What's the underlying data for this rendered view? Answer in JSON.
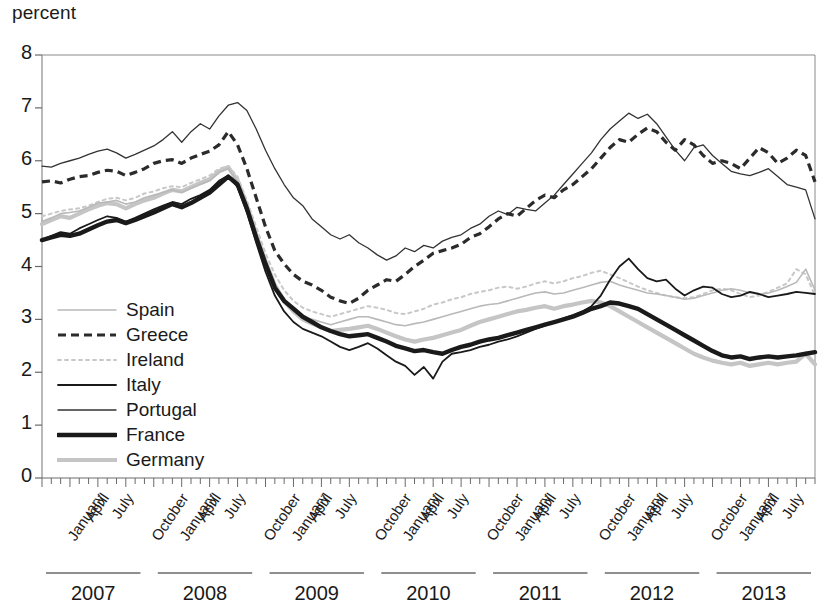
{
  "chart_data": {
    "type": "line",
    "title": "percent",
    "ylabel": "percent",
    "xlabel": "",
    "ylim": [
      0,
      8
    ],
    "yticks": [
      0,
      1,
      2,
      3,
      4,
      5,
      6,
      7,
      8
    ],
    "grid": false,
    "legend_position": "inside-left",
    "x_tick_labels": [
      "January",
      "April",
      "July",
      "October",
      "January",
      "April",
      "July",
      "October",
      "January",
      "April",
      "July",
      "October",
      "January",
      "April",
      "July",
      "October",
      "January",
      "April",
      "July",
      "October",
      "January",
      "April",
      "July",
      "October",
      "January",
      "April",
      "July",
      "December"
    ],
    "x_group_labels": [
      "2007",
      "2008",
      "2009",
      "2010",
      "2011",
      "2012",
      "2013"
    ],
    "x_months_per_group": 12,
    "x_start": "2007-01",
    "x_end": "2013-12",
    "series": [
      {
        "name": "Spain",
        "style": "thin-light-gray",
        "color": "#b9b9b9",
        "values": [
          4.85,
          4.92,
          5.0,
          5.02,
          5.05,
          5.12,
          5.2,
          5.22,
          5.25,
          5.18,
          5.22,
          5.3,
          5.35,
          5.4,
          5.45,
          5.4,
          5.48,
          5.55,
          5.62,
          5.78,
          5.85,
          5.6,
          5.1,
          4.55,
          4.05,
          3.6,
          3.3,
          3.15,
          3.05,
          3.0,
          2.95,
          2.9,
          2.95,
          3.0,
          3.05,
          3.05,
          3.0,
          2.95,
          2.9,
          2.88,
          2.92,
          2.95,
          3.0,
          3.05,
          3.1,
          3.15,
          3.2,
          3.25,
          3.28,
          3.3,
          3.35,
          3.4,
          3.45,
          3.5,
          3.52,
          3.48,
          3.5,
          3.55,
          3.6,
          3.65,
          3.7,
          3.72,
          3.65,
          3.6,
          3.55,
          3.5,
          3.48,
          3.45,
          3.42,
          3.38,
          3.4,
          3.45,
          3.5,
          3.55,
          3.58,
          3.55,
          3.5,
          3.48,
          3.5,
          3.55,
          3.62,
          3.7,
          3.95,
          3.55
        ]
      },
      {
        "name": "Greece",
        "style": "dashed-black",
        "color": "#2b2b2b",
        "values": [
          5.6,
          5.62,
          5.58,
          5.65,
          5.7,
          5.72,
          5.78,
          5.82,
          5.8,
          5.72,
          5.78,
          5.85,
          5.95,
          6.0,
          6.02,
          5.95,
          6.05,
          6.12,
          6.18,
          6.3,
          6.55,
          6.3,
          5.85,
          5.3,
          4.75,
          4.3,
          4.05,
          3.85,
          3.72,
          3.65,
          3.55,
          3.42,
          3.35,
          3.3,
          3.4,
          3.55,
          3.65,
          3.75,
          3.72,
          3.85,
          4.0,
          4.12,
          4.25,
          4.3,
          4.35,
          4.42,
          4.55,
          4.62,
          4.75,
          4.9,
          5.0,
          4.95,
          5.1,
          5.25,
          5.35,
          5.3,
          5.45,
          5.55,
          5.7,
          5.85,
          6.05,
          6.25,
          6.4,
          6.35,
          6.5,
          6.62,
          6.55,
          6.35,
          6.2,
          6.4,
          6.3,
          6.1,
          5.95,
          6.0,
          5.95,
          5.85,
          6.05,
          6.25,
          6.15,
          5.95,
          6.05,
          6.2,
          6.1,
          5.6
        ]
      },
      {
        "name": "Ireland",
        "style": "dotted-light-gray",
        "color": "#c8c8c8",
        "values": [
          4.95,
          5.0,
          5.05,
          5.08,
          5.1,
          5.15,
          5.22,
          5.28,
          5.3,
          5.25,
          5.3,
          5.38,
          5.42,
          5.48,
          5.52,
          5.5,
          5.58,
          5.65,
          5.72,
          5.85,
          5.9,
          5.7,
          5.25,
          4.75,
          4.25,
          3.85,
          3.55,
          3.35,
          3.22,
          3.15,
          3.1,
          3.05,
          3.1,
          3.15,
          3.2,
          3.25,
          3.22,
          3.18,
          3.12,
          3.1,
          3.15,
          3.2,
          3.28,
          3.32,
          3.38,
          3.42,
          3.48,
          3.52,
          3.55,
          3.6,
          3.62,
          3.58,
          3.62,
          3.68,
          3.72,
          3.68,
          3.72,
          3.78,
          3.82,
          3.88,
          3.92,
          3.85,
          3.78,
          3.7,
          3.62,
          3.55,
          3.5,
          3.45,
          3.42,
          3.4,
          3.42,
          3.48,
          3.55,
          3.58,
          3.55,
          3.48,
          3.42,
          3.45,
          3.52,
          3.6,
          3.68,
          3.95,
          3.85,
          3.45
        ]
      },
      {
        "name": "Italy",
        "style": "thin-black",
        "color": "#1a1a1a",
        "values": [
          4.5,
          4.58,
          4.65,
          4.62,
          4.72,
          4.8,
          4.88,
          4.95,
          4.92,
          4.85,
          4.92,
          5.0,
          5.08,
          5.15,
          5.22,
          5.18,
          5.28,
          5.35,
          5.45,
          5.62,
          5.72,
          5.5,
          5.02,
          4.45,
          3.9,
          3.45,
          3.15,
          2.95,
          2.82,
          2.75,
          2.68,
          2.58,
          2.48,
          2.42,
          2.48,
          2.55,
          2.45,
          2.32,
          2.2,
          2.12,
          1.95,
          2.1,
          1.88,
          2.2,
          2.35,
          2.38,
          2.42,
          2.48,
          2.52,
          2.58,
          2.62,
          2.68,
          2.75,
          2.82,
          2.88,
          2.95,
          3.02,
          3.08,
          3.15,
          3.25,
          3.45,
          3.75,
          4.0,
          4.15,
          3.95,
          3.78,
          3.72,
          3.75,
          3.58,
          3.45,
          3.55,
          3.62,
          3.6,
          3.48,
          3.42,
          3.45,
          3.52,
          3.48,
          3.42,
          3.45,
          3.48,
          3.52,
          3.5,
          3.48
        ]
      },
      {
        "name": "Portugal",
        "style": "thin-black-fine",
        "color": "#333333",
        "values": [
          5.9,
          5.88,
          5.95,
          6.0,
          6.05,
          6.12,
          6.18,
          6.22,
          6.15,
          6.05,
          6.12,
          6.2,
          6.28,
          6.4,
          6.55,
          6.35,
          6.55,
          6.7,
          6.6,
          6.85,
          7.05,
          7.1,
          6.95,
          6.6,
          6.2,
          5.85,
          5.55,
          5.3,
          5.15,
          4.9,
          4.75,
          4.6,
          4.52,
          4.6,
          4.45,
          4.35,
          4.22,
          4.12,
          4.2,
          4.35,
          4.28,
          4.4,
          4.35,
          4.48,
          4.55,
          4.6,
          4.72,
          4.8,
          4.95,
          5.05,
          4.98,
          5.12,
          5.08,
          5.05,
          5.2,
          5.35,
          5.55,
          5.75,
          5.95,
          6.15,
          6.4,
          6.6,
          6.75,
          6.9,
          6.8,
          6.88,
          6.7,
          6.45,
          6.2,
          6.0,
          6.25,
          6.3,
          6.1,
          5.95,
          5.8,
          5.75,
          5.72,
          5.78,
          5.85,
          5.7,
          5.55,
          5.5,
          5.45,
          4.9
        ]
      },
      {
        "name": "France",
        "style": "thick-black",
        "color": "#1a1a1a",
        "values": [
          4.5,
          4.55,
          4.6,
          4.58,
          4.62,
          4.7,
          4.78,
          4.85,
          4.88,
          4.82,
          4.88,
          4.95,
          5.02,
          5.1,
          5.18,
          5.12,
          5.2,
          5.3,
          5.4,
          5.55,
          5.7,
          5.55,
          5.1,
          4.55,
          4.05,
          3.6,
          3.35,
          3.2,
          3.05,
          2.95,
          2.85,
          2.78,
          2.72,
          2.68,
          2.7,
          2.72,
          2.65,
          2.58,
          2.5,
          2.45,
          2.4,
          2.42,
          2.38,
          2.35,
          2.42,
          2.48,
          2.52,
          2.58,
          2.62,
          2.65,
          2.7,
          2.75,
          2.8,
          2.85,
          2.9,
          2.95,
          3.0,
          3.05,
          3.12,
          3.2,
          3.25,
          3.32,
          3.3,
          3.25,
          3.2,
          3.1,
          3.0,
          2.9,
          2.8,
          2.7,
          2.6,
          2.5,
          2.4,
          2.32,
          2.28,
          2.3,
          2.25,
          2.28,
          2.3,
          2.28,
          2.3,
          2.32,
          2.35,
          2.38
        ]
      },
      {
        "name": "Germany",
        "style": "thick-light-gray",
        "color": "#c5c5c5",
        "values": [
          4.8,
          4.88,
          4.95,
          4.92,
          5.0,
          5.08,
          5.15,
          5.2,
          5.18,
          5.1,
          5.18,
          5.25,
          5.3,
          5.38,
          5.45,
          5.42,
          5.5,
          5.58,
          5.65,
          5.8,
          5.88,
          5.62,
          5.15,
          4.6,
          4.1,
          3.65,
          3.35,
          3.15,
          3.0,
          2.92,
          2.85,
          2.78,
          2.8,
          2.82,
          2.85,
          2.88,
          2.82,
          2.75,
          2.68,
          2.62,
          2.58,
          2.62,
          2.65,
          2.7,
          2.75,
          2.8,
          2.88,
          2.95,
          3.0,
          3.05,
          3.1,
          3.15,
          3.18,
          3.22,
          3.25,
          3.2,
          3.25,
          3.28,
          3.32,
          3.35,
          3.32,
          3.25,
          3.15,
          3.05,
          2.95,
          2.85,
          2.75,
          2.65,
          2.55,
          2.45,
          2.35,
          2.28,
          2.22,
          2.18,
          2.15,
          2.18,
          2.12,
          2.15,
          2.18,
          2.15,
          2.18,
          2.2,
          2.35,
          2.15
        ]
      }
    ]
  },
  "legend": {
    "items": [
      {
        "label": "Spain"
      },
      {
        "label": "Greece"
      },
      {
        "label": "Ireland"
      },
      {
        "label": "Italy"
      },
      {
        "label": "Portugal"
      },
      {
        "label": "France"
      },
      {
        "label": "Germany"
      }
    ]
  }
}
